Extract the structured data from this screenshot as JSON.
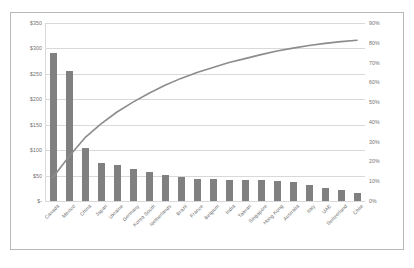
{
  "chart_data": {
    "type": "bar",
    "title": "",
    "subtitle": "",
    "xlabel": "",
    "ylabel": "",
    "y2label": "",
    "grid": true,
    "legend": "none",
    "categories": [
      "Canada",
      "Mexico",
      "China",
      "Japan",
      "Ukraine",
      "Germany",
      "Korea South",
      "Netherlands",
      "Brazil",
      "France",
      "Belgium",
      "India",
      "Taiwan",
      "Singapore",
      "Hong Kong",
      "Australia",
      "Italy",
      "UAE",
      "Switzerland",
      "Chile"
    ],
    "series": [
      {
        "name": "Value",
        "type": "bar",
        "axis": "left",
        "values": [
          292,
          256,
          105,
          75,
          70,
          63,
          58,
          52,
          47,
          44,
          43,
          42,
          41,
          41,
          40,
          37,
          32,
          26,
          21,
          16
        ]
      },
      {
        "name": "Cumulative %",
        "type": "line",
        "axis": "right",
        "values": [
          12,
          22.5,
          32,
          39,
          45,
          50,
          54.5,
          58.5,
          62,
          65,
          67.5,
          70,
          72,
          74,
          75.8,
          77.3,
          78.6,
          79.7,
          80.6,
          81.3
        ]
      }
    ],
    "yticks_left": [
      "$350",
      "$300",
      "$250",
      "$200",
      "$150",
      "$100",
      "$50",
      "$-"
    ],
    "yticks_left_values": [
      350,
      300,
      250,
      200,
      150,
      100,
      50,
      0
    ],
    "ylim": [
      0,
      350
    ],
    "yticks_right": [
      "90%",
      "80%",
      "70%",
      "60%",
      "50%",
      "40%",
      "30%",
      "20%",
      "10%",
      "0%"
    ],
    "yticks_right_values": [
      90,
      80,
      70,
      60,
      50,
      40,
      30,
      20,
      10,
      0
    ],
    "y2lim": [
      0,
      90
    ],
    "colors": {
      "bar": "#808080",
      "line": "#8c8c8c",
      "grid": "#d9d9d9",
      "text": "#707070",
      "frame": "#b8b8b8",
      "background": "#ffffff"
    }
  }
}
